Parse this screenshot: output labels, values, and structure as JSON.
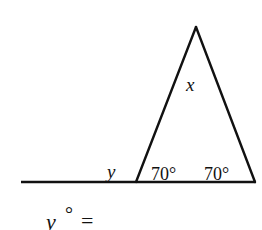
{
  "diagram": {
    "type": "triangle-exterior-angle",
    "stroke_color": "#111111",
    "background": "#ffffff",
    "labels": {
      "apex_angle": "x",
      "exterior_angle": "y",
      "base_left_angle": "70°",
      "base_right_angle": "70°"
    },
    "question": {
      "variable": "y",
      "degree": "°",
      "equals": "="
    }
  }
}
